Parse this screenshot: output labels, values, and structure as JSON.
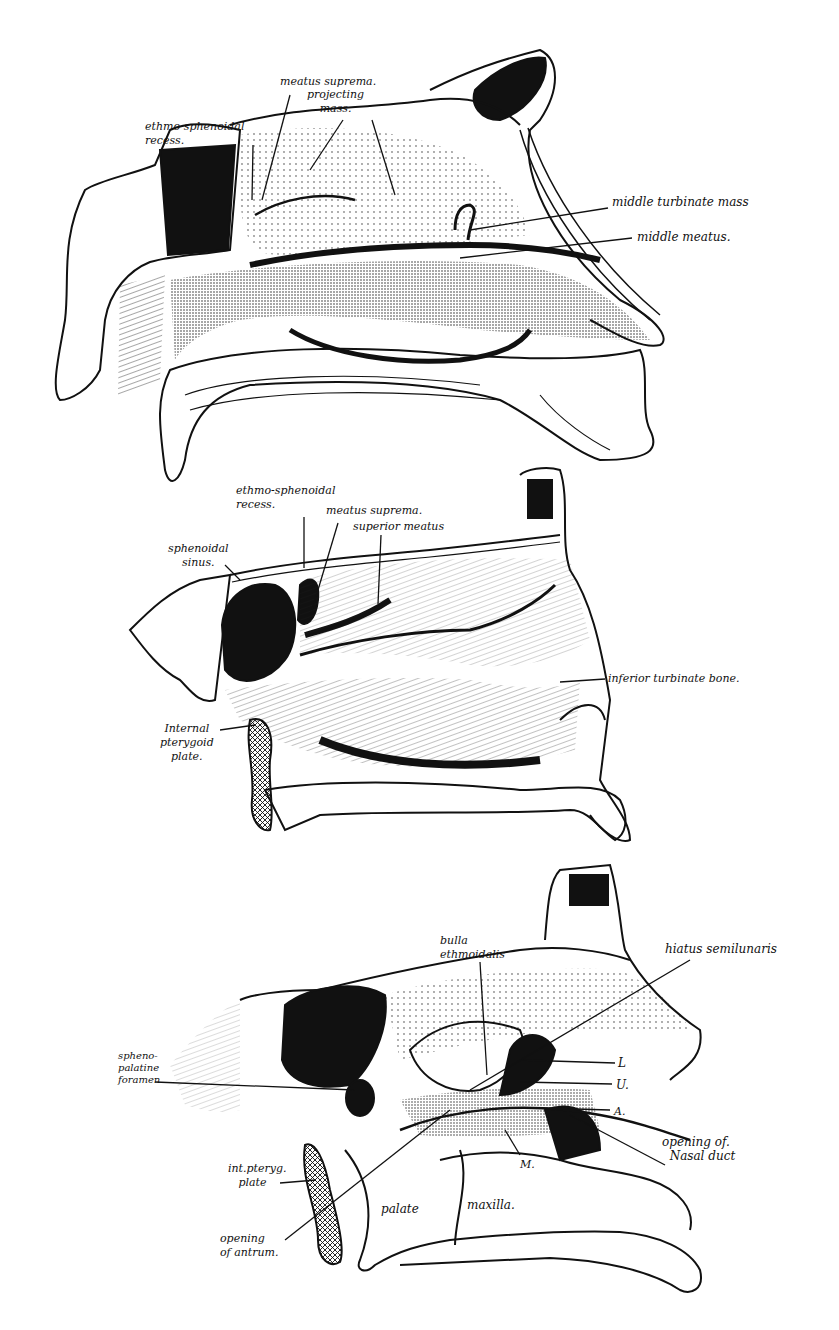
{
  "figures": [
    {
      "id": "fig-top",
      "description": "Lateral wall of nasal cavity (mucosa intact)",
      "labels": [
        {
          "key": "ethmo_sphenoidal_recess",
          "text": "ethmo-sphenoidal\nrecess.",
          "x": 145,
          "y": 120
        },
        {
          "key": "meatus_suprema",
          "text": "meatus suprema.",
          "x": 280,
          "y": 75
        },
        {
          "key": "projecting_mass",
          "text": "projecting\nmass.",
          "x": 307,
          "y": 88
        },
        {
          "key": "middle_turbinate_mass",
          "text": "middle turbinate mass",
          "x": 612,
          "y": 195
        },
        {
          "key": "middle_meatus",
          "text": "middle meatus.",
          "x": 637,
          "y": 230
        }
      ]
    },
    {
      "id": "fig-middle",
      "description": "Lateral wall after removal of middle turbinate",
      "labels": [
        {
          "key": "ethmo_sphenoidal_recess",
          "text": "ethmo-sphenoidal\nrecess.",
          "x": 236,
          "y": 484
        },
        {
          "key": "meatus_suprema",
          "text": "meatus suprema.",
          "x": 326,
          "y": 504
        },
        {
          "key": "superior_meatus",
          "text": "superior meatus",
          "x": 353,
          "y": 520
        },
        {
          "key": "sphenoidal_sinus",
          "text": "sphenoidal\nsinus.",
          "x": 168,
          "y": 542
        },
        {
          "key": "inferior_turbinate_bone",
          "text": "inferior turbinate bone.",
          "x": 608,
          "y": 672
        },
        {
          "key": "internal_pterygoid_plate",
          "text": "Internal\npterygoid\nplate.",
          "x": 160,
          "y": 722
        }
      ]
    },
    {
      "id": "fig-bottom",
      "description": "Lateral wall showing openings of sinuses and ducts",
      "labels": [
        {
          "key": "bulla_ethmoidalis",
          "text": "bulla\nethmoidalis",
          "x": 440,
          "y": 934
        },
        {
          "key": "hiatus_semilunaris",
          "text": "hiatus semilunaris",
          "x": 665,
          "y": 942
        },
        {
          "key": "spheno_palatine_foramen",
          "text": "spheno-\npalatine\nforamen",
          "x": 118,
          "y": 1050
        },
        {
          "key": "L",
          "text": "L",
          "x": 618,
          "y": 1056
        },
        {
          "key": "U",
          "text": "U.",
          "x": 616,
          "y": 1078
        },
        {
          "key": "A",
          "text": "A.",
          "x": 614,
          "y": 1105
        },
        {
          "key": "opening_of_nasal_duct",
          "text": "opening of.\n  Nasal duct",
          "x": 662,
          "y": 1135
        },
        {
          "key": "M",
          "text": "M.",
          "x": 520,
          "y": 1158
        },
        {
          "key": "int_pteryg_plate",
          "text": "int.pteryg.\n   plate",
          "x": 228,
          "y": 1162
        },
        {
          "key": "palate",
          "text": "palate",
          "x": 381,
          "y": 1202
        },
        {
          "key": "maxilla",
          "text": "maxilla.",
          "x": 467,
          "y": 1198
        },
        {
          "key": "opening_of_antrum",
          "text": "opening\nof antrum.",
          "x": 220,
          "y": 1232
        }
      ]
    }
  ]
}
